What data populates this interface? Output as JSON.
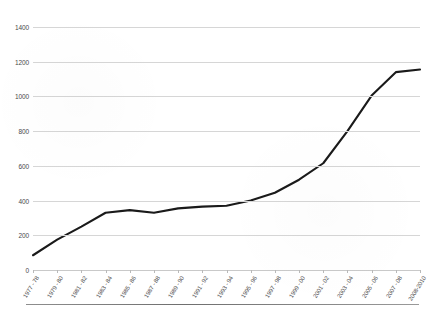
{
  "chart_data": {
    "type": "line",
    "title": "",
    "xlabel": "",
    "ylabel": "",
    "categories": [
      "1977 - 78",
      "1979 - 80",
      "1981 - 82",
      "1983 - 84",
      "1985 - 86",
      "1987 - 88",
      "1989 - 90",
      "1991 - 92",
      "1993 - 94",
      "1995 - 96",
      "1997 - 98",
      "1999 - 00",
      "2001 - 02",
      "2003 - 04",
      "2005 - 06",
      "2007 - 08",
      "2008-2010"
    ],
    "values": [
      85,
      175,
      250,
      330,
      345,
      330,
      355,
      365,
      370,
      400,
      445,
      520,
      615,
      800,
      1005,
      1140,
      1155
    ],
    "ylim": [
      0,
      1400
    ],
    "yticks": [
      0,
      200,
      400,
      600,
      800,
      1000,
      1200,
      1400
    ],
    "ytick_labels": [
      "0",
      "200",
      "400",
      "600",
      "800",
      "1000",
      "1200",
      "1400"
    ],
    "grid": true,
    "legend": false,
    "legend_position": "none",
    "series": [
      {
        "name": "series-1",
        "color": "#1a1a1a",
        "values": [
          85,
          175,
          250,
          330,
          345,
          330,
          355,
          365,
          370,
          400,
          445,
          520,
          615,
          800,
          1005,
          1140,
          1155
        ]
      }
    ],
    "annotations": []
  },
  "style": {
    "line_color": "#1a1a1a",
    "gridline_color": "#d6d6d6",
    "axis_color": "#c9c9c9",
    "text_color": "#4a4a4a",
    "background": "#ffffff"
  }
}
